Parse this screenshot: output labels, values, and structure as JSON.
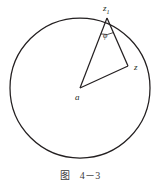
{
  "figure": {
    "caption_label": "图",
    "caption_number": "4－3",
    "background_color": "#ffffff",
    "stroke_color": "#231f20"
  },
  "diagram": {
    "type": "geometric-diagram",
    "circle": {
      "center_x": 80,
      "center_y": 88,
      "radius": 70,
      "label": ""
    },
    "points": [
      {
        "id": "z1",
        "label": "z",
        "subscript": "1",
        "x": 107,
        "y": 17
      },
      {
        "id": "a",
        "label": "a",
        "subscript": "",
        "x": 80,
        "y": 88
      },
      {
        "id": "z",
        "label": "z",
        "subscript": "",
        "x": 128,
        "y": 65
      }
    ],
    "segments": [
      {
        "from": "a",
        "to": "z1"
      },
      {
        "from": "a",
        "to": "z"
      },
      {
        "from": "z1",
        "to": "z"
      }
    ],
    "angle": {
      "label": "φ",
      "at_point": "z1",
      "between": [
        "z1-a",
        "z1-z"
      ],
      "x": 106,
      "y": 33
    }
  }
}
